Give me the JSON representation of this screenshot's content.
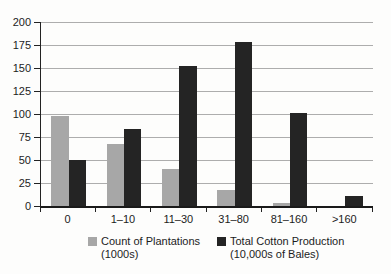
{
  "chart_data": {
    "type": "bar",
    "title": "",
    "xlabel": "",
    "ylabel": "",
    "categories": [
      "0",
      "1–10",
      "11–30",
      "31–80",
      "81–160",
      ">160"
    ],
    "series": [
      {
        "name": "Count of Plantations (1000s)",
        "legend_lines": [
          "Count of Plantations",
          "(1000s)"
        ],
        "color": "#a7a7a7",
        "values": [
          98,
          67,
          40,
          17,
          3,
          0
        ]
      },
      {
        "name": "Total Cotton Production (10,000s of Bales)",
        "legend_lines": [
          "Total Cotton Production",
          "(10,000s of Bales)"
        ],
        "color": "#242424",
        "values": [
          50,
          84,
          152,
          178,
          101,
          11
        ]
      }
    ],
    "ylim": [
      0,
      200
    ],
    "yticks": [
      0,
      25,
      50,
      75,
      100,
      125,
      150,
      175,
      200
    ],
    "grid": true,
    "legend_position": "bottom"
  },
  "colors": {
    "gridline": "#adadad",
    "axis": "#1f1f1f",
    "text": "#1c1c1c",
    "background": "#fdfdfc"
  }
}
